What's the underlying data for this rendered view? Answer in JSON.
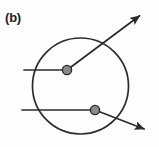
{
  "figure": {
    "panel_label": "(b)",
    "caption": "",
    "width": 159,
    "height": 147,
    "background_color": "#fdfdfd",
    "stroke_color": "#2b2b2b",
    "node_fill_color": "#8a8a8a",
    "node_stroke_color": "#2b2b2b",
    "label_color": "#1c1c1c"
  },
  "chart_data": {
    "type": "diagram",
    "title": "(b)",
    "circle": {
      "name": "boundary-circle",
      "cx": 80.5,
      "cy": 86,
      "r": 48,
      "stroke": "#2b2b2b",
      "stroke_width": 1.7,
      "fill": "none"
    },
    "scattering_centers": [
      {
        "name": "upper-scattering-center",
        "cx": 67,
        "cy": 70,
        "r": 4.6
      },
      {
        "name": "lower-scattering-center",
        "cx": 95,
        "cy": 110,
        "r": 4.6
      }
    ],
    "rays": [
      {
        "name": "upper-incoming-ray",
        "kind": "incoming",
        "x1": 24,
        "y1": 70,
        "x2": 67,
        "y2": 70,
        "arrow": false
      },
      {
        "name": "upper-outgoing-ray",
        "kind": "outgoing",
        "x1": 67,
        "y1": 70,
        "x2": 142,
        "y2": 14,
        "arrow": true
      },
      {
        "name": "lower-incoming-ray",
        "kind": "incoming",
        "x1": 22,
        "y1": 110,
        "x2": 95,
        "y2": 110,
        "arrow": false
      },
      {
        "name": "lower-outgoing-ray",
        "kind": "outgoing",
        "x1": 95,
        "y1": 110,
        "x2": 147,
        "y2": 130,
        "arrow": true
      }
    ],
    "grid": false,
    "legend": null,
    "xlabel": "",
    "ylabel": ""
  }
}
